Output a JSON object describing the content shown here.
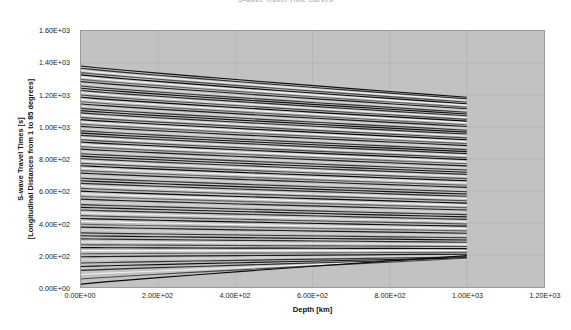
{
  "chart_data": {
    "type": "line",
    "title": "S-wave Travel Time Curves",
    "xlabel": "Depth [km]",
    "ylabel_line1": "S-wave Travel Times [s]",
    "ylabel_line2": "[Longitudinal Distances from 1 to 85 degrees]",
    "xlim": [
      0,
      1200
    ],
    "ylim": [
      0,
      1600
    ],
    "xticks": [
      0,
      200,
      400,
      600,
      800,
      1000,
      1200
    ],
    "xticklabels": [
      "0.00E+00",
      "2.00E+02",
      "4.00E+02",
      "6.00E+02",
      "8.00E+02",
      "1.00E+03",
      "1.20E+03"
    ],
    "yticks": [
      0,
      200,
      400,
      600,
      800,
      1000,
      1200,
      1400,
      1600
    ],
    "yticklabels": [
      "0.00E+00",
      "2.00E+02",
      "4.00E+02",
      "6.00E+02",
      "8.00E+02",
      "1.00E+03",
      "1.20E+03",
      "1.40E+03",
      "1.60E+03"
    ],
    "grid": true,
    "legend": "none",
    "plot_background": "#c2c2c2",
    "data_x_range": [
      0,
      1000
    ],
    "x_samples": [
      0,
      35,
      70,
      120,
      200,
      300,
      410,
      520,
      620,
      710,
      800,
      900,
      1000
    ],
    "series_note": "85 S-wave travel-time curves, one per epicentral distance from 1 to 85 degrees; y value at depth 0 km and at depth 1000 km",
    "series": [
      {
        "name": "85 deg",
        "y0": 1381,
        "y1000": 1186
      },
      {
        "name": "84 deg",
        "y0": 1367,
        "y1000": 1176
      },
      {
        "name": "83 deg",
        "y0": 1353,
        "y1000": 1166
      },
      {
        "name": "82 deg",
        "y0": 1340,
        "y1000": 1156
      },
      {
        "name": "81 deg",
        "y0": 1326,
        "y1000": 1145
      },
      {
        "name": "80 deg",
        "y0": 1312,
        "y1000": 1135
      },
      {
        "name": "79 deg",
        "y0": 1298,
        "y1000": 1124
      },
      {
        "name": "78 deg",
        "y0": 1284,
        "y1000": 1114
      },
      {
        "name": "77 deg",
        "y0": 1270,
        "y1000": 1103
      },
      {
        "name": "76 deg",
        "y0": 1256,
        "y1000": 1092
      },
      {
        "name": "75 deg",
        "y0": 1242,
        "y1000": 1081
      },
      {
        "name": "74 deg",
        "y0": 1228,
        "y1000": 1070
      },
      {
        "name": "73 deg",
        "y0": 1214,
        "y1000": 1059
      },
      {
        "name": "72 deg",
        "y0": 1200,
        "y1000": 1048
      },
      {
        "name": "71 deg",
        "y0": 1186,
        "y1000": 1037
      },
      {
        "name": "70 deg",
        "y0": 1172,
        "y1000": 1026
      },
      {
        "name": "69 deg",
        "y0": 1158,
        "y1000": 1014
      },
      {
        "name": "68 deg",
        "y0": 1144,
        "y1000": 1003
      },
      {
        "name": "67 deg",
        "y0": 1130,
        "y1000": 991
      },
      {
        "name": "66 deg",
        "y0": 1116,
        "y1000": 980
      },
      {
        "name": "65 deg",
        "y0": 1102,
        "y1000": 968
      },
      {
        "name": "64 deg",
        "y0": 1088,
        "y1000": 956
      },
      {
        "name": "63 deg",
        "y0": 1074,
        "y1000": 944
      },
      {
        "name": "62 deg",
        "y0": 1060,
        "y1000": 932
      },
      {
        "name": "61 deg",
        "y0": 1046,
        "y1000": 920
      },
      {
        "name": "60 deg",
        "y0": 1032,
        "y1000": 908
      },
      {
        "name": "59 deg",
        "y0": 1018,
        "y1000": 896
      },
      {
        "name": "58 deg",
        "y0": 1004,
        "y1000": 884
      },
      {
        "name": "57 deg",
        "y0": 990,
        "y1000": 871
      },
      {
        "name": "56 deg",
        "y0": 976,
        "y1000": 859
      },
      {
        "name": "55 deg",
        "y0": 962,
        "y1000": 846
      },
      {
        "name": "54 deg",
        "y0": 948,
        "y1000": 834
      },
      {
        "name": "53 deg",
        "y0": 934,
        "y1000": 821
      },
      {
        "name": "52 deg",
        "y0": 920,
        "y1000": 808
      },
      {
        "name": "51 deg",
        "y0": 906,
        "y1000": 796
      },
      {
        "name": "50 deg",
        "y0": 891,
        "y1000": 783
      },
      {
        "name": "49 deg",
        "y0": 877,
        "y1000": 770
      },
      {
        "name": "48 deg",
        "y0": 862,
        "y1000": 757
      },
      {
        "name": "47 deg",
        "y0": 848,
        "y1000": 744
      },
      {
        "name": "46 deg",
        "y0": 833,
        "y1000": 731
      },
      {
        "name": "45 deg",
        "y0": 818,
        "y1000": 717
      },
      {
        "name": "44 deg",
        "y0": 803,
        "y1000": 704
      },
      {
        "name": "43 deg",
        "y0": 788,
        "y1000": 691
      },
      {
        "name": "42 deg",
        "y0": 773,
        "y1000": 677
      },
      {
        "name": "41 deg",
        "y0": 758,
        "y1000": 664
      },
      {
        "name": "40 deg",
        "y0": 743,
        "y1000": 650
      },
      {
        "name": "39 deg",
        "y0": 727,
        "y1000": 636
      },
      {
        "name": "38 deg",
        "y0": 712,
        "y1000": 623
      },
      {
        "name": "37 deg",
        "y0": 696,
        "y1000": 609
      },
      {
        "name": "36 deg",
        "y0": 680,
        "y1000": 595
      },
      {
        "name": "35 deg",
        "y0": 664,
        "y1000": 581
      },
      {
        "name": "34 deg",
        "y0": 648,
        "y1000": 567
      },
      {
        "name": "33 deg",
        "y0": 632,
        "y1000": 553
      },
      {
        "name": "32 deg",
        "y0": 616,
        "y1000": 539
      },
      {
        "name": "31 deg",
        "y0": 599,
        "y1000": 524
      },
      {
        "name": "30 deg",
        "y0": 583,
        "y1000": 510
      },
      {
        "name": "29 deg",
        "y0": 566,
        "y1000": 496
      },
      {
        "name": "28 deg",
        "y0": 549,
        "y1000": 481
      },
      {
        "name": "27 deg",
        "y0": 532,
        "y1000": 467
      },
      {
        "name": "26 deg",
        "y0": 515,
        "y1000": 452
      },
      {
        "name": "25 deg",
        "y0": 498,
        "y1000": 438
      },
      {
        "name": "24 deg",
        "y0": 481,
        "y1000": 423
      },
      {
        "name": "23 deg",
        "y0": 463,
        "y1000": 409
      },
      {
        "name": "22 deg",
        "y0": 446,
        "y1000": 394
      },
      {
        "name": "21 deg",
        "y0": 428,
        "y1000": 380
      },
      {
        "name": "20 deg",
        "y0": 410,
        "y1000": 365
      },
      {
        "name": "19 deg",
        "y0": 392,
        "y1000": 351
      },
      {
        "name": "18 deg",
        "y0": 374,
        "y1000": 336
      },
      {
        "name": "17 deg",
        "y0": 356,
        "y1000": 322
      },
      {
        "name": "16 deg",
        "y0": 338,
        "y1000": 308
      },
      {
        "name": "15 deg",
        "y0": 320,
        "y1000": 294
      },
      {
        "name": "14 deg",
        "y0": 301,
        "y1000": 280
      },
      {
        "name": "13 deg",
        "y0": 283,
        "y1000": 266
      },
      {
        "name": "12 deg",
        "y0": 264,
        "y1000": 253
      },
      {
        "name": "11 deg",
        "y0": 246,
        "y1000": 240
      },
      {
        "name": "10 deg",
        "y0": 227,
        "y1000": 228
      },
      {
        "name": "9 deg",
        "y0": 208,
        "y1000": 216
      },
      {
        "name": "8 deg",
        "y0": 189,
        "y1000": 205
      },
      {
        "name": "7 deg",
        "y0": 170,
        "y1000": 196
      },
      {
        "name": "6 deg",
        "y0": 150,
        "y1000": 188
      },
      {
        "name": "5 deg",
        "y0": 128,
        "y1000": 182
      },
      {
        "name": "4 deg",
        "y0": 104,
        "y1000": 178
      },
      {
        "name": "3 deg",
        "y0": 78,
        "y1000": 176
      },
      {
        "name": "2 deg",
        "y0": 50,
        "y1000": 180
      },
      {
        "name": "1 deg",
        "y0": 18,
        "y1000": 196
      }
    ]
  }
}
